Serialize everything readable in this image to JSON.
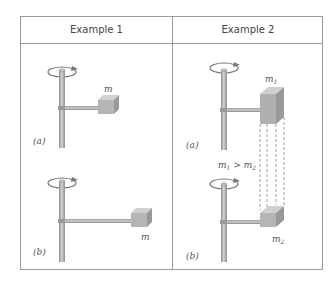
{
  "table": {
    "columns": [
      {
        "header": "Example 1"
      },
      {
        "header": "Example 2"
      }
    ]
  },
  "example1": {
    "a": {
      "label": "(a)",
      "mass_label": "m"
    },
    "b": {
      "label": "(b)",
      "mass_label": "m"
    }
  },
  "example2": {
    "a": {
      "label": "(a)",
      "mass_label": "m",
      "mass_sub": "1"
    },
    "b": {
      "label": "(b)",
      "mass_label": "m",
      "mass_sub": "2"
    },
    "comparison": {
      "m1": "m",
      "s1": "1",
      "op": " > ",
      "m2": "m",
      "s2": "2"
    }
  },
  "colors": {
    "border": "#9a9a9a",
    "rod": "#a8a8a8",
    "block": "#b5b5b5",
    "text": "#555555"
  }
}
